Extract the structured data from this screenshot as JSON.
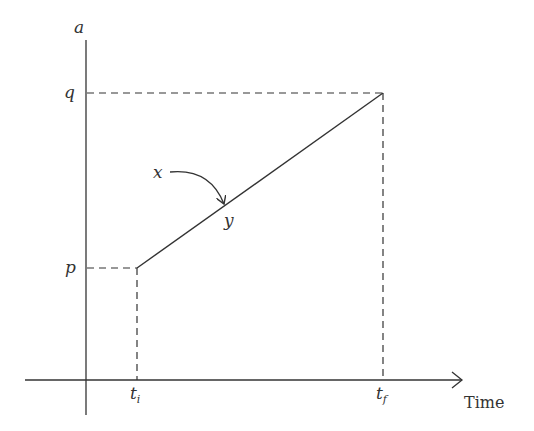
{
  "diagram": {
    "y_axis_label": "a",
    "x_axis_label": "Time",
    "y_ticks": [
      {
        "label": "q",
        "level": "high"
      },
      {
        "label": "p",
        "level": "low"
      }
    ],
    "x_ticks": [
      {
        "base": "t",
        "sub": "i"
      },
      {
        "base": "t",
        "sub": "f"
      }
    ],
    "point_label": "x",
    "line_label": "y",
    "line": {
      "from": {
        "t": "t_i",
        "a": "p"
      },
      "to": {
        "t": "t_f",
        "a": "q"
      }
    },
    "colors": {
      "stroke": "#333333",
      "background": "#ffffff"
    }
  }
}
